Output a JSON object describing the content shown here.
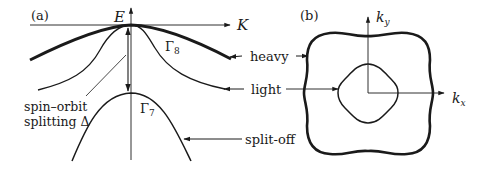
{
  "panel_a": {
    "label": "(a)",
    "axis_y_label": "E",
    "axis_x_label": "K",
    "gamma8": "Γ",
    "gamma8_sub": "8",
    "gamma7": "Γ",
    "gamma7_sub": "7",
    "so_line1": "spin–orbit",
    "so_line2": "splitting Δ",
    "band_heavy": "heavy",
    "band_light": "light",
    "band_splitoff": "split-off"
  },
  "panel_b": {
    "label": "(b)",
    "axis_y_label": "k",
    "axis_y_sub": "y",
    "axis_x_label": "k",
    "axis_x_sub": "x"
  },
  "colors": {
    "ink": "#1a1a1a",
    "background": "#ffffff"
  }
}
